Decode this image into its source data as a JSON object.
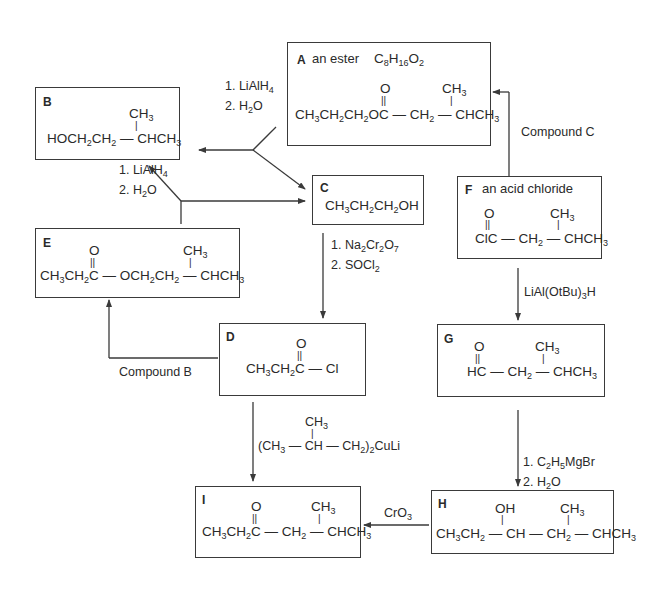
{
  "compounds": {
    "A": {
      "letter": "A",
      "description": "an ester",
      "formula": "C8H16O2",
      "structure": {
        "carbonyl_O": "O",
        "branch": "CH3",
        "main_chain": "CH3CH2CH2OC — CH2 — CHCH3"
      }
    },
    "B": {
      "letter": "B",
      "description": "",
      "structure": {
        "branch": "CH3",
        "main_chain": "HOCH2CH2 — CHCH3"
      }
    },
    "C": {
      "letter": "C",
      "description": "",
      "structure": {
        "main_chain": "CH3CH2CH2OH"
      }
    },
    "D": {
      "letter": "D",
      "description": "",
      "structure": {
        "carbonyl_O": "O",
        "main_chain": "CH3CH2C — Cl"
      }
    },
    "E": {
      "letter": "E",
      "description": "",
      "structure": {
        "carbonyl_O": "O",
        "branch": "CH3",
        "main_chain": "CH3CH2C — OCH2CH2 — CHCH3"
      }
    },
    "F": {
      "letter": "F",
      "description": "an acid chloride",
      "structure": {
        "carbonyl_O": "O",
        "branch": "CH3",
        "main_chain": "ClC — CH2 — CHCH3"
      }
    },
    "G": {
      "letter": "G",
      "description": "",
      "structure": {
        "carbonyl_O": "O",
        "branch": "CH3",
        "main_chain": "HC — CH2 — CHCH3"
      }
    },
    "H": {
      "letter": "H",
      "description": "",
      "structure": {
        "hydroxyl": "OH",
        "branch": "CH3",
        "main_chain": "CH3CH2 — CH — CH2 — CHCH3"
      }
    },
    "I": {
      "letter": "I",
      "description": "",
      "structure": {
        "carbonyl_O": "O",
        "branch": "CH3",
        "main_chain": "CH3CH2C — CH2 — CHCH3"
      }
    }
  },
  "reactions": [
    {
      "from": "A",
      "to": [
        "B",
        "C"
      ],
      "reagents": [
        "1. LiAlH4",
        "2. H2O"
      ]
    },
    {
      "from": "E",
      "to": [
        "B",
        "C"
      ],
      "reagents": [
        "1. LiAlH4",
        "2. H2O"
      ]
    },
    {
      "from": "C",
      "to": [
        "D"
      ],
      "reagents": [
        "1. Na2Cr2O7",
        "2. SOCl2"
      ]
    },
    {
      "from": "D",
      "to": [
        "E"
      ],
      "reagents": [
        "Compound B"
      ]
    },
    {
      "from": "F",
      "to": [
        "A"
      ],
      "reagents": [
        "Compound C"
      ]
    },
    {
      "from": "F",
      "to": [
        "G"
      ],
      "reagents": [
        "LiAl(OtBu)3H"
      ]
    },
    {
      "from": "G",
      "to": [
        "H"
      ],
      "reagents": [
        "1. C2H5MgBr",
        "2. H2O"
      ]
    },
    {
      "from": "D",
      "to": [
        "I"
      ],
      "reagents": [
        "(CH3 — CH(CH3) — CH2)2CuLi"
      ]
    },
    {
      "from": "H",
      "to": [
        "I"
      ],
      "reagents": [
        "CrO3"
      ]
    }
  ],
  "labels": {
    "compound_b": "Compound B",
    "compound_c": "Compound C",
    "lialh4_1": "1. LiAlH",
    "h2o_2": "2. H",
    "na2cr2o7": "1. Na",
    "socl2": "2. SOCl",
    "lialotbu": "LiAl(OtBu)",
    "c2h5mgbr": "1. C",
    "cro3": "CrO",
    "cuprate_branch": "CH3"
  },
  "colors": {
    "line": "#3a3a3a",
    "text": "#2a2a2a",
    "background": "#ffffff"
  }
}
